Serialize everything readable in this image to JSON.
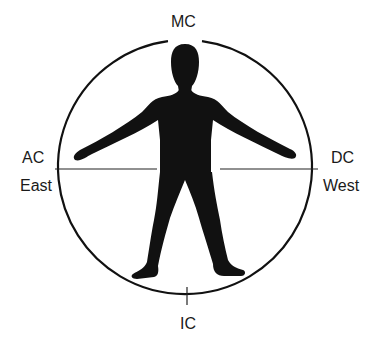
{
  "diagram": {
    "labels": {
      "top": "MC",
      "bottom": "IC",
      "left_top": "AC",
      "left_bottom": "East",
      "right_top": "DC",
      "right_bottom": "West"
    },
    "colors": {
      "ink": "#111111",
      "background": "#ffffff"
    }
  }
}
